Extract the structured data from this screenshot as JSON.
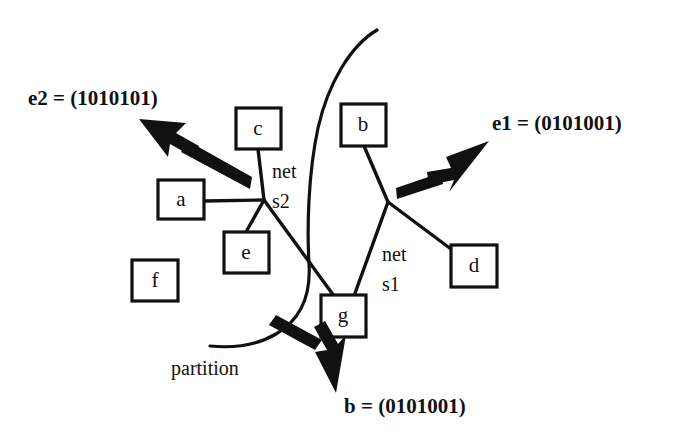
{
  "figure": {
    "background_color": "#ffffff",
    "ink_color": "#111111",
    "width": 680,
    "height": 443
  },
  "cells": [
    {
      "id": "a",
      "label": "a",
      "x": 158,
      "y": 180,
      "w": 46,
      "h": 39,
      "cx": 181,
      "cy": 200
    },
    {
      "id": "c",
      "label": "c",
      "x": 236,
      "y": 108,
      "w": 45,
      "h": 41,
      "cx": 258,
      "cy": 129
    },
    {
      "id": "e",
      "label": "e",
      "x": 224,
      "y": 232,
      "w": 45,
      "h": 41,
      "cx": 246,
      "cy": 253
    },
    {
      "id": "f",
      "label": "f",
      "x": 132,
      "y": 260,
      "w": 46,
      "h": 41,
      "cx": 155,
      "cy": 281
    },
    {
      "id": "b",
      "label": "b",
      "x": 341,
      "y": 104,
      "w": 45,
      "h": 42,
      "cx": 363,
      "cy": 126
    },
    {
      "id": "d",
      "label": "d",
      "x": 451,
      "y": 245,
      "w": 46,
      "h": 42,
      "cx": 474,
      "cy": 266
    },
    {
      "id": "g",
      "label": "g",
      "x": 321,
      "y": 295,
      "w": 45,
      "h": 42,
      "cx": 343,
      "cy": 316
    }
  ],
  "nets": [
    {
      "id": "s2",
      "label_line1": "net",
      "label_line2": "s2",
      "label_x": 272,
      "label_y1": 175,
      "label_y2": 205,
      "junction": {
        "x": 264,
        "y": 200
      },
      "terminals": [
        "a",
        "c",
        "e",
        "g"
      ]
    },
    {
      "id": "s1",
      "label_line1": "net",
      "label_line2": "s1",
      "label_x": 382,
      "label_y1": 258,
      "label_y2": 288,
      "junction": {
        "x": 388,
        "y": 202
      },
      "terminals": [
        "b",
        "d",
        "g"
      ]
    }
  ],
  "annotations": {
    "e2": {
      "text": "e2 = (1010101)",
      "x": 28,
      "y": 105,
      "arrow_tail": {
        "x": 252,
        "y": 183
      },
      "arrow_tip": {
        "x": 139,
        "y": 119
      }
    },
    "e1": {
      "text": "e1 = (0101001)",
      "x": 492,
      "y": 130,
      "arrow_tail": {
        "x": 396,
        "y": 193
      },
      "arrow_tip": {
        "x": 489,
        "y": 141
      }
    },
    "b_vector": {
      "text": "b = (0101001)",
      "x": 344,
      "y": 413,
      "arrow_tail": {
        "x": 276,
        "y": 320
      },
      "arrow_tip": {
        "x": 336,
        "y": 393
      }
    },
    "partition": {
      "text": "partition",
      "x": 171,
      "y": 375
    }
  },
  "partition_curve": {
    "description": "open S-shaped cut line separating the two halves of the netlist",
    "start": {
      "x": 377,
      "y": 30
    },
    "end": {
      "x": 210,
      "y": 346
    }
  },
  "encoding_legend": {
    "bit_length": 7,
    "e1_bits": "0101001",
    "e2_bits": "1010101",
    "b_bits": "0101001"
  }
}
